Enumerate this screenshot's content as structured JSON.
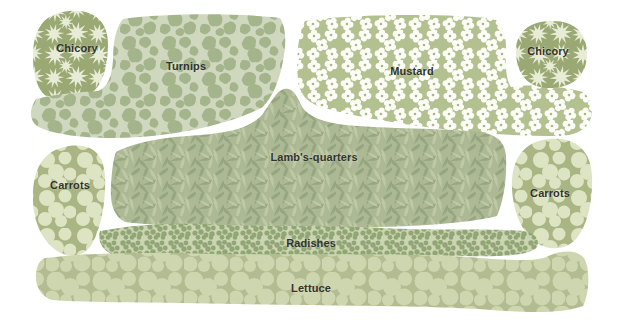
{
  "patches": [
    {
      "id": "chicory-left",
      "label": "Chicory"
    },
    {
      "id": "turnips",
      "label": "Turnips"
    },
    {
      "id": "mustard",
      "label": "Mustard"
    },
    {
      "id": "chicory-right",
      "label": "Chicory"
    },
    {
      "id": "carrots-left",
      "label": "Carrots"
    },
    {
      "id": "lambs-quarters",
      "label": "Lamb's-quarters"
    },
    {
      "id": "carrots-right",
      "label": "Carrots"
    },
    {
      "id": "radishes",
      "label": "Radishes"
    },
    {
      "id": "lettuce",
      "label": "Lettuce"
    }
  ],
  "palette": {
    "background": "#ffffff",
    "label_text": "#32322a",
    "chicory_bg": "#9aa873",
    "chicory_flower": "#e8ecd6",
    "turnips_bg": "#d0d7bf",
    "turnips_leaf": "#a4b48b",
    "mustard_bg": "#b3c08f",
    "mustard_flower": "#fdfdf8",
    "lambsquarters_bg": "#acb994",
    "lambsquarters_dark": "#96a67e",
    "lambsquarters_light": "#bdc8a5",
    "carrots_bg": "#a9b583",
    "carrots_top": "#dde4c4",
    "radishes_bg": "#ccd4b3",
    "radishes_leaf": "#90a674",
    "lettuce_bg": "#b3bc91",
    "lettuce_head": "#ced6af"
  }
}
